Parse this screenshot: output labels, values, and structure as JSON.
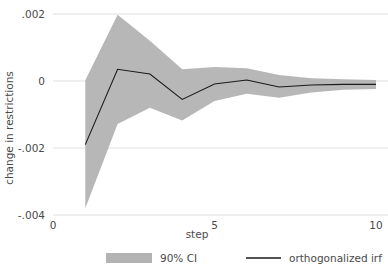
{
  "chart_data": {
    "type": "line",
    "title": "",
    "xlabel": "step",
    "ylabel": "change in restrictions",
    "x": [
      1,
      2,
      3,
      4,
      5,
      6,
      7,
      8,
      9,
      10
    ],
    "xlim": [
      0,
      10
    ],
    "ylim": [
      -0.004,
      0.002
    ],
    "xticks": [
      "0",
      "5",
      "10"
    ],
    "xtick_values": [
      0,
      5,
      10
    ],
    "yticks": [
      ".002",
      "0",
      "-.002",
      "-.004"
    ],
    "ytick_values": [
      0.002,
      0,
      -0.002,
      -0.004
    ],
    "grid": "horizontal",
    "legend_position": "bottom",
    "series": [
      {
        "name": "orthogonalized irf",
        "type": "line",
        "color": "#1a1a1a",
        "values": [
          -0.0019,
          0.00035,
          0.00021,
          -0.00055,
          -9e-05,
          3e-05,
          -0.00018,
          -0.00012,
          -0.0001,
          -0.0001
        ]
      },
      {
        "name": "90% CI",
        "type": "band",
        "color": "#b3b3b3",
        "upper": [
          2e-05,
          0.00198,
          0.0012,
          0.00035,
          0.00042,
          0.00038,
          0.00018,
          8e-05,
          5e-05,
          3e-05
        ],
        "lower": [
          -0.0038,
          -0.00128,
          -0.0008,
          -0.00118,
          -0.0006,
          -0.00038,
          -0.0005,
          -0.00034,
          -0.00026,
          -0.00024
        ]
      }
    ]
  },
  "legend": {
    "items": [
      {
        "label": "90% CI",
        "marker": "swatch",
        "color": "#b3b3b3"
      },
      {
        "label": "orthogonalized irf",
        "marker": "line",
        "color": "#1a1a1a"
      }
    ]
  },
  "axes": {
    "y_title": "change in restrictions",
    "x_title": "step"
  }
}
